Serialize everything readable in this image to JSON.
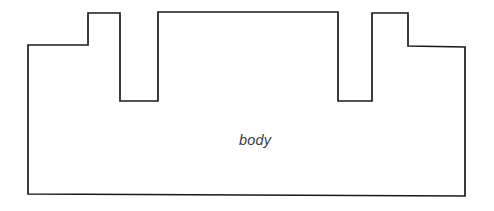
{
  "canvas": {
    "width": 494,
    "height": 211,
    "background_color": "#ffffff"
  },
  "diagram": {
    "name": "body-outline-diagram",
    "type": "polygon-outline",
    "stroke_color": "#1a1a1a",
    "fill_color": "#ffffff",
    "stroke_width": 1.7,
    "label": {
      "text": "body",
      "x": 255,
      "y": 145,
      "color": "#3d3d3d",
      "font_size": 14.5,
      "font_style": "italic"
    },
    "vertices": [
      [
        28,
        45
      ],
      [
        88,
        45
      ],
      [
        88,
        13
      ],
      [
        120,
        13
      ],
      [
        120,
        101
      ],
      [
        158,
        101
      ],
      [
        158,
        12
      ],
      [
        338,
        12
      ],
      [
        338,
        101
      ],
      [
        372,
        101
      ],
      [
        372,
        13
      ],
      [
        408,
        13
      ],
      [
        408,
        46
      ],
      [
        465,
        47
      ],
      [
        465,
        196
      ],
      [
        28,
        194
      ]
    ],
    "points_string": "28,45 88,45 88,13 120,13 120,101 158,101 158,12 338,12 338,101 372,101 372,13 408,13 408,46 465,47 465,196 28,194",
    "features": {
      "left_step_count": 1,
      "notch_count": 2,
      "tower_count": 3,
      "right_step_count": 1
    }
  }
}
